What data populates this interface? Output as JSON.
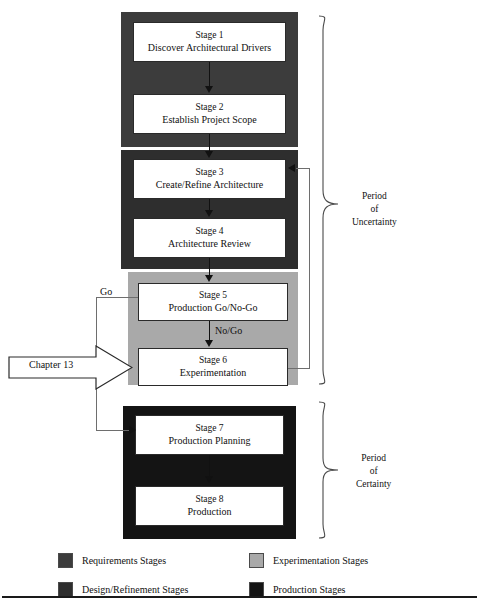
{
  "diagram": {
    "stages": [
      {
        "id": "stage1",
        "num": "Stage 1",
        "name": "Discover Architectural Drivers",
        "group": "requirements"
      },
      {
        "id": "stage2",
        "num": "Stage 2",
        "name": "Establish Project Scope",
        "group": "requirements"
      },
      {
        "id": "stage3",
        "num": "Stage 3",
        "name": "Create/Refine Architecture",
        "group": "design"
      },
      {
        "id": "stage4",
        "num": "Stage 4",
        "name": "Architecture Review",
        "group": "design"
      },
      {
        "id": "stage5",
        "num": "Stage 5",
        "name": "Production Go/No-Go",
        "group": "experimentation"
      },
      {
        "id": "stage6",
        "num": "Stage 6",
        "name": "Experimentation",
        "group": "experimentation"
      },
      {
        "id": "stage7",
        "num": "Stage 7",
        "name": "Production Planning",
        "group": "production"
      },
      {
        "id": "stage8",
        "num": "Stage 8",
        "name": "Production",
        "group": "production"
      }
    ],
    "edge_labels": {
      "go": "Go",
      "no_go": "No/Go"
    },
    "callout": {
      "label": "Chapter 13"
    },
    "periods": [
      {
        "id": "uncertainty",
        "line1": "Period",
        "line2": "of",
        "line3": "Uncertainty"
      },
      {
        "id": "certainty",
        "line1": "Period",
        "line2": "of",
        "line3": "Certainty"
      }
    ]
  },
  "legend": {
    "items": [
      {
        "label": "Requirements Stages",
        "color": "#3c3c3c"
      },
      {
        "label": "Experimentation Stages",
        "color": "#a9a9a9"
      },
      {
        "label": "Design/Refinement Stages",
        "color": "#2e2e2e"
      },
      {
        "label": "Production Stages",
        "color": "#141414"
      }
    ]
  },
  "colors": {
    "requirements": "#3c3c3c",
    "design": "#2e2e2e",
    "experimentation": "#a9a9a9",
    "production": "#141414",
    "box_fill": "#ffffff",
    "line": "#111111"
  }
}
